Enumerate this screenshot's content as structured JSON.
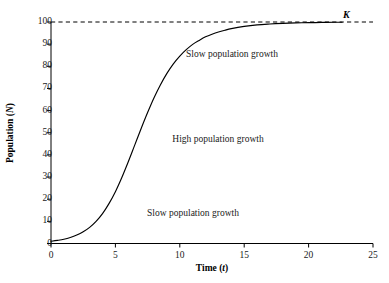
{
  "chart_data": {
    "type": "line",
    "title": "",
    "subtitle": "",
    "xlabel": "Time (t)",
    "ylabel": "Population (N)",
    "xlabel_text": "Time",
    "xlabel_symbol": "t",
    "ylabel_text": "Population",
    "ylabel_symbol": "N",
    "xlim": [
      0,
      25
    ],
    "ylim": [
      0,
      100
    ],
    "xticks": [
      0,
      5,
      10,
      15,
      20,
      25
    ],
    "yticks": [
      0,
      10,
      20,
      30,
      40,
      50,
      60,
      70,
      80,
      90,
      100
    ],
    "xticklabels": [
      "0",
      "5",
      "10",
      "15",
      "20",
      "25"
    ],
    "yticklabels": [
      "0",
      "10",
      "20",
      "30",
      "40",
      "50",
      "60",
      "70",
      "80",
      "90",
      "100"
    ],
    "grid": false,
    "legend": false,
    "legend_position": "none",
    "line_color": "#000000",
    "background_color": "#ffffff",
    "axis_color": "#000000",
    "series": [
      {
        "name": "Logistic population growth",
        "curve_type": "logistic",
        "carrying_capacity": 100,
        "initial_value": 1,
        "growth_rate": 0.68,
        "inflection_t": 6.8,
        "inflection_n": 50,
        "x": [
          0,
          0.5,
          1,
          1.5,
          2,
          2.5,
          3,
          3.5,
          4,
          4.5,
          5,
          5.5,
          6,
          6.5,
          7,
          7.5,
          8,
          8.5,
          9,
          9.5,
          10,
          10.5,
          11,
          11.5,
          12,
          12.5,
          13,
          13.5,
          14,
          15,
          16,
          17,
          18,
          19,
          20,
          21,
          22,
          22.6
        ],
        "values": [
          1.0,
          1.4,
          1.9,
          2.7,
          3.8,
          5.3,
          7.3,
          10.0,
          13.5,
          18.0,
          23.4,
          29.8,
          36.9,
          44.4,
          51.9,
          59.1,
          65.8,
          71.7,
          76.8,
          81.1,
          84.6,
          87.5,
          89.9,
          91.7,
          93.3,
          94.5,
          95.5,
          96.3,
          97.0,
          98.0,
          98.7,
          99.1,
          99.4,
          99.6,
          99.7,
          99.8,
          99.9,
          99.9
        ]
      }
    ],
    "reference_lines": [
      {
        "name": "carrying-capacity-asymptote",
        "orientation": "horizontal",
        "value": 100,
        "label": "K",
        "style": "dashed",
        "color": "#000000"
      }
    ],
    "annotations": [
      {
        "id": "annotation-top",
        "text": "Slow population growth",
        "x": 11.4,
        "y": 85
      },
      {
        "id": "annotation-middle",
        "text": "High population growth",
        "x": 10.8,
        "y": 47
      },
      {
        "id": "annotation-bottom",
        "text": "Slow population growth",
        "x": 9.1,
        "y": 13
      }
    ]
  },
  "axes": {
    "x_title_text": "Time",
    "x_title_symbol": "t",
    "y_title_text": "Population",
    "y_title_symbol": "N"
  },
  "labels": {
    "carrying_capacity": "K",
    "annotation_top": "Slow population growth",
    "annotation_middle": "High population growth",
    "annotation_bottom": "Slow population growth",
    "ytick_100": "100",
    "ytick_90": "90",
    "ytick_80": "80",
    "ytick_70": "70",
    "ytick_60": "60",
    "ytick_50": "50",
    "ytick_40": "40",
    "ytick_30": "30",
    "ytick_20": "20",
    "ytick_10": "10",
    "ytick_0": "0",
    "xtick_0": "0",
    "xtick_5": "5",
    "xtick_10": "10",
    "xtick_15": "15",
    "xtick_20": "20",
    "xtick_25": "25"
  }
}
